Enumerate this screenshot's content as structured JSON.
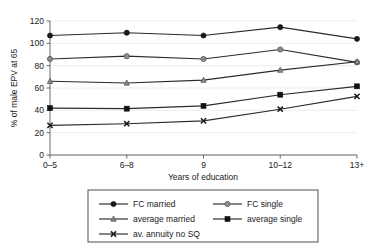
{
  "chart_data": {
    "type": "line",
    "title": "",
    "xlabel": "Years of education",
    "ylabel": "% of male EPV at 65",
    "categories": [
      "0–5",
      "6–8",
      "9",
      "10–12",
      "13+"
    ],
    "ylim": [
      0,
      120
    ],
    "yticks": [
      0,
      20,
      40,
      60,
      80,
      100,
      120
    ],
    "ytick_labels": [
      "0",
      "20",
      "40",
      "60",
      "80",
      "100",
      "120"
    ],
    "grid": true,
    "legend_position": "below-plot",
    "series": [
      {
        "name": "FC married",
        "marker": "filled-circle",
        "color": "#1a1a1a",
        "values": [
          107,
          109.5,
          107,
          114.5,
          104
        ]
      },
      {
        "name": "FC single",
        "marker": "circle-gray",
        "color": "#6e6e6e",
        "values": [
          86,
          88.5,
          86,
          94.5,
          83
        ]
      },
      {
        "name": "average married",
        "marker": "triangle-gray",
        "color": "#6e6e6e",
        "values": [
          66,
          64.5,
          67,
          76,
          83.5
        ]
      },
      {
        "name": "average single",
        "marker": "filled-square",
        "color": "#111111",
        "values": [
          42,
          41.5,
          44,
          54,
          61.5
        ]
      },
      {
        "name": "av. annuity no SQ",
        "marker": "cross",
        "color": "#1a1a1a",
        "values": [
          26.5,
          28,
          30.5,
          41,
          52.5
        ]
      }
    ]
  },
  "legend": {
    "entries": [
      {
        "label": "FC married"
      },
      {
        "label": "FC single"
      },
      {
        "label": "average married"
      },
      {
        "label": "average single"
      },
      {
        "label": "av. annuity no SQ"
      }
    ]
  }
}
